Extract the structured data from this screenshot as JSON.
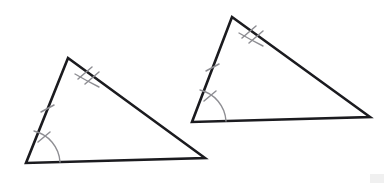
{
  "page": {
    "title": "Congruent Triangles Diagram",
    "background_color": "#ffffff",
    "width": 387,
    "height": 186
  },
  "style": {
    "edge_color": "#1b1b1f",
    "edge_width": 2.6,
    "mark_color": "#8e8e93",
    "mark_width": 1.5,
    "watermark_color": "#ededed"
  },
  "chart_data": {
    "type": "diagram",
    "title": "Congruent Triangles Diagram",
    "shapes": [
      {
        "name": "left-triangle",
        "label": "Triangle 1",
        "vertices": [
          {
            "name": "apex",
            "x": 68,
            "y": 58
          },
          {
            "name": "bottom-right",
            "x": 205,
            "y": 158
          },
          {
            "name": "bottom-left",
            "x": 26,
            "y": 163
          }
        ],
        "marks": [
          {
            "name": "double-tick-upper-edge",
            "type": "tick",
            "count": 2,
            "edge": "apex-to-bottom-right"
          },
          {
            "name": "single-tick-left-edge",
            "type": "tick",
            "count": 1,
            "edge": "bottom-left-to-apex"
          },
          {
            "name": "angle-arc-bottom-left",
            "type": "angle-arc",
            "count": 1,
            "vertex": "bottom-left"
          }
        ]
      },
      {
        "name": "right-triangle",
        "label": "Triangle 2",
        "vertices": [
          {
            "name": "apex",
            "x": 232,
            "y": 17
          },
          {
            "name": "bottom-right",
            "x": 370,
            "y": 117
          },
          {
            "name": "bottom-left",
            "x": 192,
            "y": 122
          }
        ],
        "marks": [
          {
            "name": "double-tick-upper-edge",
            "type": "tick",
            "count": 2,
            "edge": "apex-to-bottom-right"
          },
          {
            "name": "single-tick-left-edge",
            "type": "tick",
            "count": 1,
            "edge": "bottom-left-to-apex"
          },
          {
            "name": "angle-arc-bottom-left",
            "type": "angle-arc",
            "count": 1,
            "vertex": "bottom-left"
          }
        ]
      }
    ],
    "annotations": [],
    "legend": [],
    "grid": false
  }
}
